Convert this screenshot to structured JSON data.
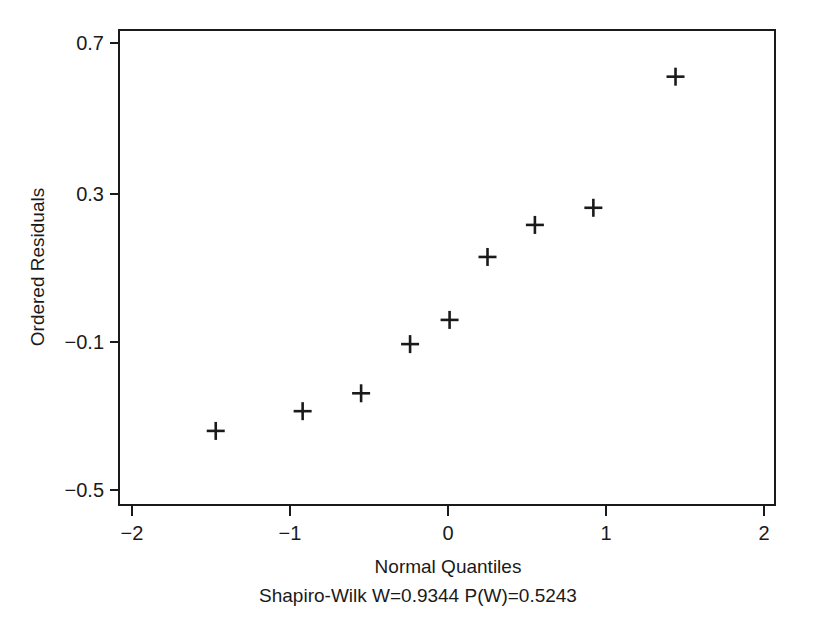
{
  "chart_data": {
    "type": "scatter",
    "title": "",
    "subtitle": "Shapiro-Wilk W=0.9344  P(W)=0.5243",
    "xlabel": "Normal Quantiles",
    "ylabel": "Ordered Residuals",
    "xlim": [
      -2.08,
      2.07
    ],
    "ylim": [
      -0.539,
      0.743
    ],
    "grid": false,
    "legend": null,
    "marker": "plus",
    "marker_color": "#1a1a1a",
    "xticks": [
      -2,
      -1,
      0,
      1,
      2
    ],
    "xtick_labels": [
      "−2",
      "−1",
      "0",
      "1",
      "2"
    ],
    "yticks": [
      0.7,
      0.3,
      -0.1,
      -0.5
    ],
    "ytick_labels": [
      "0.7",
      "0.3",
      "−0.1",
      "−0.5"
    ],
    "x": [
      -1.47,
      -0.92,
      -0.55,
      -0.24,
      0.01,
      0.25,
      0.55,
      0.92,
      1.44
    ],
    "y": [
      -0.336,
      -0.283,
      -0.235,
      -0.103,
      -0.038,
      0.131,
      0.217,
      0.263,
      0.615
    ],
    "points": [
      {
        "x": -1.47,
        "y": -0.336
      },
      {
        "x": -0.92,
        "y": -0.283
      },
      {
        "x": -0.55,
        "y": -0.235
      },
      {
        "x": -0.24,
        "y": -0.103
      },
      {
        "x": 0.01,
        "y": -0.038
      },
      {
        "x": 0.25,
        "y": 0.131
      },
      {
        "x": 0.55,
        "y": 0.217
      },
      {
        "x": 0.92,
        "y": 0.263
      },
      {
        "x": 1.44,
        "y": 0.615
      }
    ],
    "n_points": 9,
    "stats": {
      "test_name": "Shapiro-Wilk",
      "W_label": "W=0.9344",
      "W": 0.9344,
      "P_label": "P(W)=0.5243",
      "P": 0.5243
    }
  },
  "axes": {
    "y_tick_0": "0.7",
    "y_tick_1": "0.3",
    "y_tick_2": "−0.1",
    "y_tick_3": "−0.5",
    "x_tick_0": "−2",
    "x_tick_1": "−1",
    "x_tick_2": "0",
    "x_tick_3": "1",
    "x_tick_4": "2",
    "x_title": "Normal Quantiles",
    "y_title": "Ordered Residuals",
    "caption": "Shapiro-Wilk W=0.9344  P(W)=0.5243"
  }
}
